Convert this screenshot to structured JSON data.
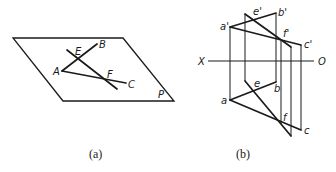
{
  "figure_a": {
    "caption": "(a)",
    "plane_label": "P",
    "points": {
      "A": "A",
      "B": "B",
      "C": "C",
      "E": "E",
      "F": "F"
    }
  },
  "figure_b": {
    "caption": "(b)",
    "axis": {
      "left": "X",
      "right": "O"
    },
    "front_view": {
      "a": "a'",
      "b": "b'",
      "c": "c'",
      "e": "e'",
      "f": "f'"
    },
    "top_view": {
      "a": "a",
      "b": "b",
      "c": "c",
      "e": "e",
      "f": "f"
    }
  }
}
